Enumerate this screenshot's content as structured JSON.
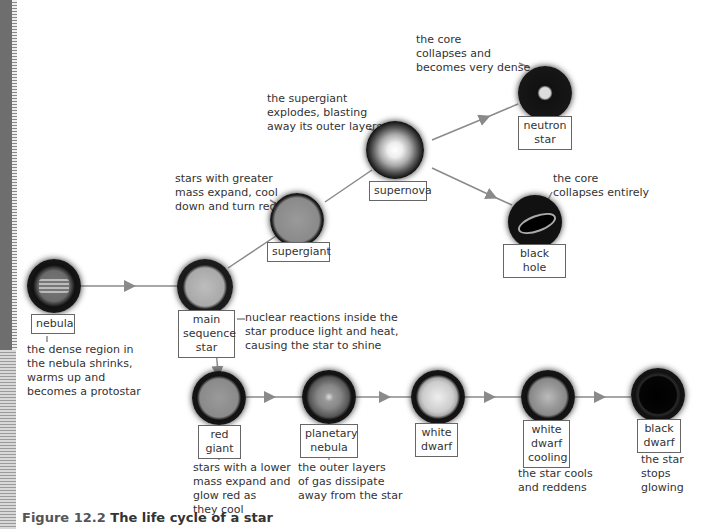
{
  "figure": {
    "number": "Figure 12.2",
    "title": "The life cycle of a star"
  },
  "stages": [
    {
      "id": "nebula",
      "label": "nebula",
      "note": "the dense region in\nthe nebula shrinks,\nwarms up and\nbecomes a protostar"
    },
    {
      "id": "main-sequence-star",
      "label": "main\nsequence\nstar",
      "note": "nuclear reactions inside the\nstar produce light and heat,\ncausing the star to shine"
    },
    {
      "id": "supergiant",
      "label": "supergiant",
      "note": "stars with greater\nmass expand, cool\ndown and turn red"
    },
    {
      "id": "supernova",
      "label": "supernova",
      "note": "the supergiant\nexplodes, blasting\naway its outer layers"
    },
    {
      "id": "neutron-star",
      "label": "neutron\nstar",
      "note": "the core\ncollapses and\nbecomes very dense"
    },
    {
      "id": "black-hole",
      "label": "black hole",
      "note": "the core\ncollapses entirely"
    },
    {
      "id": "red-giant",
      "label": "red\ngiant",
      "note": "stars with a lower\nmass expand and\nglow red as\nthey cool"
    },
    {
      "id": "planetary-nebula",
      "label": "planetary\nnebula",
      "note": "the outer layers\nof gas dissipate\naway from the star"
    },
    {
      "id": "white-dwarf",
      "label": "white\ndwarf",
      "note": ""
    },
    {
      "id": "white-dwarf-cooling",
      "label": "white\ndwarf\ncooling",
      "note": "the star cools\nand reddens"
    },
    {
      "id": "black-dwarf",
      "label": "black\ndwarf",
      "note": "the star\nstops glowing"
    }
  ],
  "colors": {
    "arrow": "#8a8a8a",
    "label_border": "#666666",
    "caption": "#333333"
  }
}
